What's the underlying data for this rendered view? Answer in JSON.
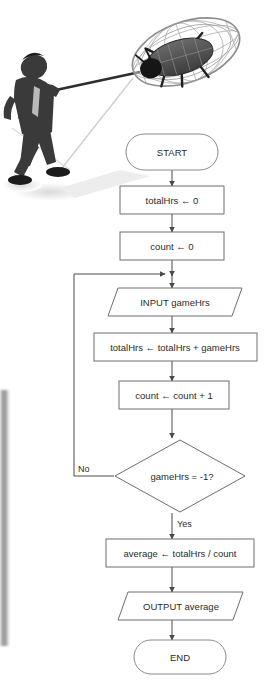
{
  "illustration": {
    "alt": "man-with-net-catching-bug",
    "figure_name": "businessman-silhouette",
    "net_name": "butterfly-net",
    "bug_name": "beetle-bug",
    "colors": {
      "figure": "#3a3a3a",
      "bug_body": "#555555",
      "bug_head": "#1c1c1c",
      "net_mesh": "#8d8d8d",
      "shadow": "#e3e3e3"
    }
  },
  "flowchart": {
    "title": "average game hours flowchart",
    "colors": {
      "shape_stroke": "#6e6e6e",
      "terminator_stroke": "#8a8a8a",
      "line": "#4a4a4a",
      "text": "#2b2b2b",
      "background": "#ffffff"
    },
    "nodes": [
      {
        "id": "start",
        "type": "terminator",
        "label": "START"
      },
      {
        "id": "init1",
        "type": "process",
        "label": "totalHrs ← 0"
      },
      {
        "id": "init2",
        "type": "process",
        "label": "count ← 0"
      },
      {
        "id": "input",
        "type": "input-output",
        "label": "INPUT gameHrs"
      },
      {
        "id": "accum",
        "type": "process",
        "label": "totalHrs ← totalHrs + gameHrs"
      },
      {
        "id": "incr",
        "type": "process",
        "label": "count ← count + 1"
      },
      {
        "id": "decide",
        "type": "decision",
        "label": "gameHrs = -1?"
      },
      {
        "id": "average",
        "type": "process",
        "label": "average ← totalHrs / count"
      },
      {
        "id": "output",
        "type": "input-output",
        "label": "OUTPUT average"
      },
      {
        "id": "end",
        "type": "terminator",
        "label": "END"
      }
    ],
    "edge_labels": {
      "no": "No",
      "yes": "Yes"
    }
  }
}
